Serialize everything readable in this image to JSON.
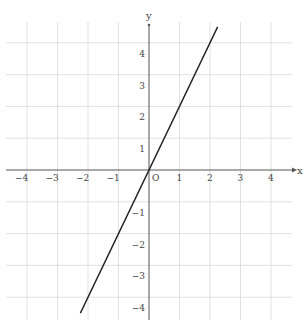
{
  "chart_data": {
    "type": "line",
    "title": "",
    "xlabel": "x",
    "ylabel": "y",
    "origin_label": "O",
    "xlim": [
      -4.5,
      4.5
    ],
    "ylim": [
      -4.5,
      4.5
    ],
    "grid": true,
    "x_ticks": [
      "−4",
      "−3",
      "−2",
      "−1",
      "1",
      "2",
      "3",
      "4"
    ],
    "y_ticks": [
      "4",
      "3",
      "2",
      "1",
      "−1",
      "−2",
      "−3",
      "−4"
    ],
    "series": [
      {
        "name": "y = 2x",
        "x": [
          -2.25,
          2.25
        ],
        "y": [
          -4.5,
          4.5
        ]
      }
    ]
  },
  "colors": {
    "grid": "#d9d9d9",
    "axis": "#555555",
    "line": "#222222"
  }
}
